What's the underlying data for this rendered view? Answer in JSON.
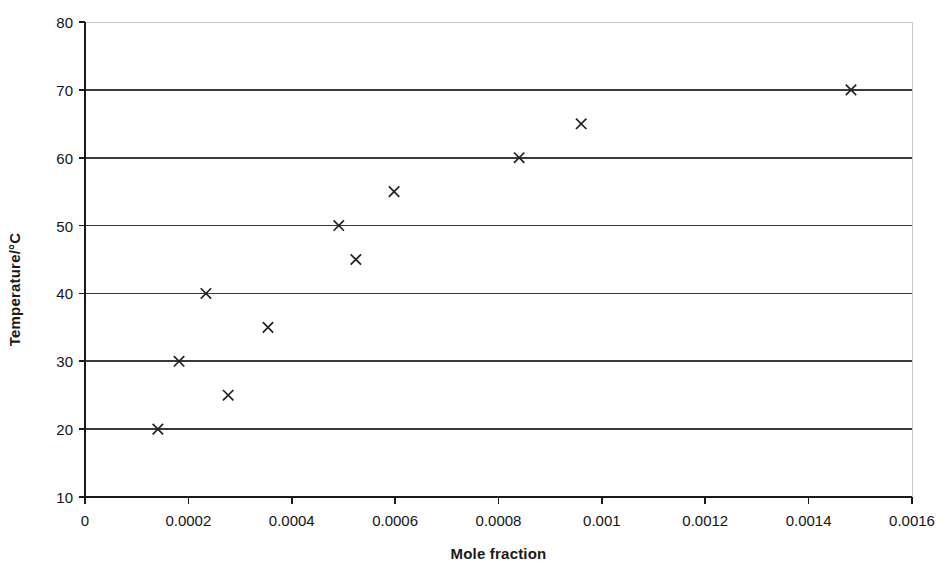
{
  "chart_data": {
    "type": "scatter",
    "title": "",
    "xlabel": "Mole fraction",
    "ylabel": "Temperature/°C",
    "xlim": [
      0,
      0.0016
    ],
    "ylim": [
      10,
      80
    ],
    "grid": true,
    "grid_axis": "y",
    "legend": false,
    "marker": "x",
    "marker_color": "#222222",
    "x_ticks": [
      0,
      0.0002,
      0.0004,
      0.0006,
      0.0008,
      0.001,
      0.0012,
      0.0014,
      0.0016
    ],
    "x_tick_labels": [
      "0",
      "0.0002",
      "0.0004",
      "0.0006",
      "0.0008",
      "0.001",
      "0.0012",
      "0.0014",
      "0.0016"
    ],
    "y_ticks": [
      10,
      20,
      30,
      40,
      50,
      60,
      70,
      80
    ],
    "y_tick_labels": [
      "10",
      "20",
      "30",
      "40",
      "50",
      "60",
      "70",
      "80"
    ],
    "series": [
      {
        "name": "solubility",
        "points": [
          {
            "x": 0.000141,
            "y": 20
          },
          {
            "x": 0.000182,
            "y": 30
          },
          {
            "x": 0.000234,
            "y": 40
          },
          {
            "x": 0.000277,
            "y": 25
          },
          {
            "x": 0.000354,
            "y": 35
          },
          {
            "x": 0.000491,
            "y": 50
          },
          {
            "x": 0.000524,
            "y": 45
          },
          {
            "x": 0.000598,
            "y": 55
          },
          {
            "x": 0.00084,
            "y": 60
          },
          {
            "x": 0.00096,
            "y": 65
          },
          {
            "x": 0.001482,
            "y": 70
          }
        ]
      }
    ]
  },
  "style": {
    "axis_color": "#1a1a1a",
    "grid_color": "#3a3a3a",
    "top_border_color": "#c8c8c8",
    "background": "#ffffff"
  }
}
